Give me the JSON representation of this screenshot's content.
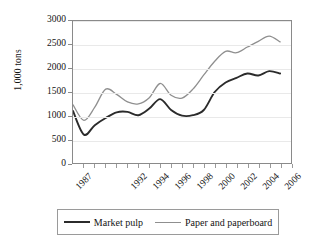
{
  "chart_data": {
    "type": "line",
    "title": "",
    "xlabel": "",
    "ylabel": "1,000 tons",
    "ylim": [
      0,
      3000
    ],
    "yticks": [
      0,
      500,
      1000,
      1500,
      2000,
      2500,
      3000
    ],
    "xlim": [
      1986,
      2006
    ],
    "xticks": [
      1987,
      1992,
      1994,
      1996,
      1998,
      2000,
      2002,
      2004,
      2006
    ],
    "x": [
      1986,
      1987,
      1988,
      1989,
      1990,
      1991,
      1992,
      1993,
      1994,
      1995,
      1996,
      1997,
      1998,
      1999,
      2000,
      2001,
      2002,
      2003,
      2004,
      2005
    ],
    "grid": true,
    "legend_position": "bottom",
    "series": [
      {
        "name": "Market pulp",
        "color": "#2b2b2b",
        "values": [
          1100,
          600,
          800,
          950,
          1070,
          1080,
          1010,
          1150,
          1350,
          1120,
          1000,
          1010,
          1120,
          1500,
          1700,
          1800,
          1890,
          1850,
          1940,
          1890
        ]
      },
      {
        "name": "Paper and paperboard",
        "color": "#8f8f8f",
        "values": [
          1230,
          900,
          1180,
          1560,
          1450,
          1290,
          1250,
          1380,
          1680,
          1430,
          1370,
          1560,
          1860,
          2150,
          2360,
          2330,
          2450,
          2570,
          2680,
          2560
        ]
      }
    ]
  },
  "axis": {
    "y_title": "1,000 tons",
    "y_tick_labels": [
      "3000",
      "2500",
      "2000",
      "1500",
      "1000",
      "500",
      "0"
    ],
    "x_tick_labels": [
      "1987",
      "1992",
      "1994",
      "1996",
      "1998",
      "2000",
      "2002",
      "2004",
      "2006"
    ]
  },
  "legend": {
    "entries": [
      {
        "label": "Market pulp",
        "style": "dark"
      },
      {
        "label": "Paper and paperboard",
        "style": "gray"
      }
    ]
  }
}
